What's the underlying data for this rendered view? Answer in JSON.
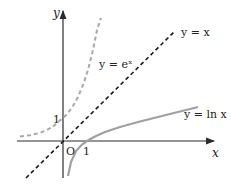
{
  "diagram": {
    "axes": {
      "x_label": "x",
      "y_label": "y",
      "origin_label": "O",
      "x_tick_label": "1",
      "y_tick_label": "1"
    },
    "curves": [
      {
        "name": "exp",
        "label": "y = eˣ",
        "style": "dashed",
        "color": "#a8a8a8"
      },
      {
        "name": "identity",
        "label": "y = x",
        "style": "dashed",
        "color": "#1a1a1a"
      },
      {
        "name": "ln",
        "label": "y = ln x",
        "style": "solid",
        "color": "#a0a0a0"
      }
    ],
    "colors": {
      "axis": "#2a2a2a",
      "text": "#222222",
      "background": "#ffffff"
    }
  }
}
